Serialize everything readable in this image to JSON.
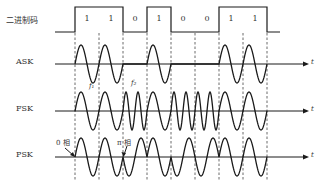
{
  "figure": {
    "bits": [
      1,
      1,
      0,
      1,
      0,
      0,
      1,
      1
    ],
    "bit_labels": [
      "1",
      "1",
      "0",
      "1",
      "0",
      "0",
      "1",
      "1"
    ],
    "rows": {
      "binary": {
        "label": "二进制码"
      },
      "ask": {
        "label": "ASK",
        "axis_label": "t"
      },
      "fsk": {
        "label": "FSK",
        "axis_label": "t",
        "f1_label": "f₁",
        "f2_label": "f₂"
      },
      "psk": {
        "label": "PSK",
        "axis_label": "t",
        "zero_phase_label": "0 相",
        "pi_phase_label": "π 相"
      }
    },
    "colors": {
      "line": "#1a1a1a",
      "dashed": "#444444",
      "text": "#333333"
    }
  }
}
